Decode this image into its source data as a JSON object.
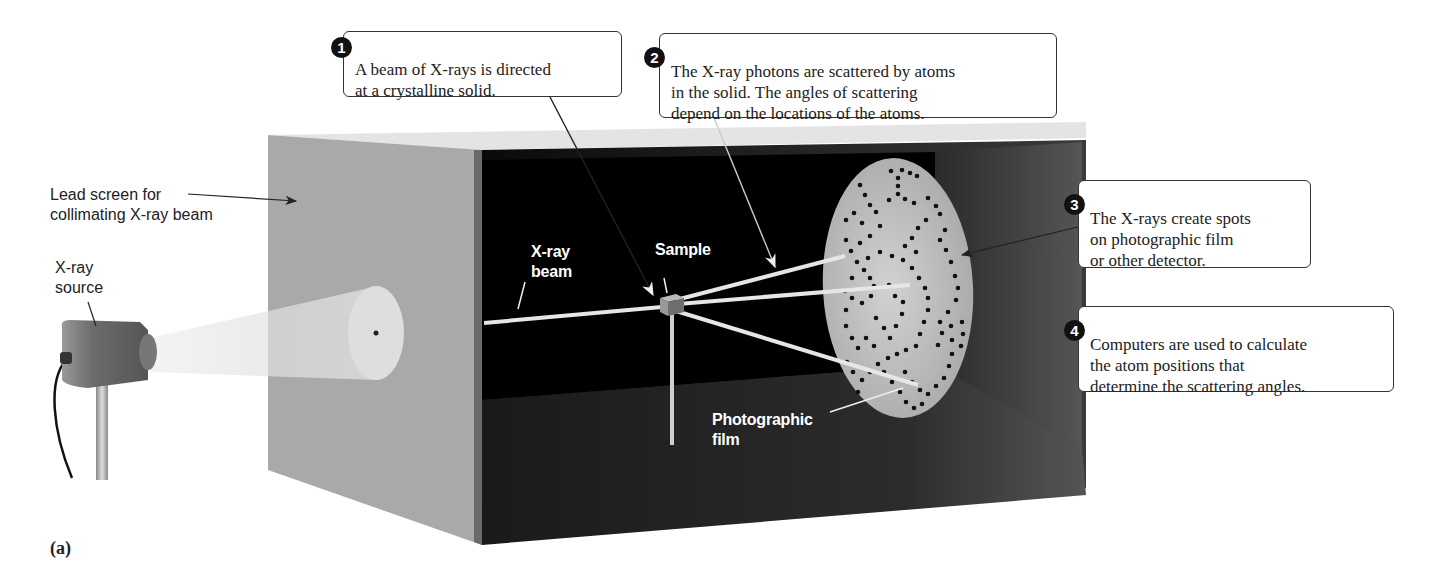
{
  "figure": {
    "panel_label": "(a)",
    "callouts": [
      {
        "number": "1",
        "text": "A beam of X-rays is directed\nat a crystalline solid."
      },
      {
        "number": "2",
        "text": "The X-ray photons are scattered by atoms\nin the solid. The angles of scattering\ndepend on the locations of the atoms."
      },
      {
        "number": "3",
        "text": "The X-rays create spots\non photographic film\nor other detector."
      },
      {
        "number": "4",
        "text": "Computers are used to calculate\nthe atom positions that\ndetermine the scattering angles."
      }
    ],
    "labels": {
      "lead_screen": "Lead screen for\ncollimating X-ray beam",
      "xray_source": "X-ray\nsource",
      "xray_beam": "X-ray\nbeam",
      "sample": "Sample",
      "photographic_film": "Photographic\nfilm"
    },
    "colors": {
      "lead_screen": "#a9a9a9",
      "box_interior": "#050505",
      "box_floor": "#2a2a2a",
      "film": "#b8b8b8",
      "beam": "#e6e6e6",
      "spot": "#111111"
    }
  }
}
